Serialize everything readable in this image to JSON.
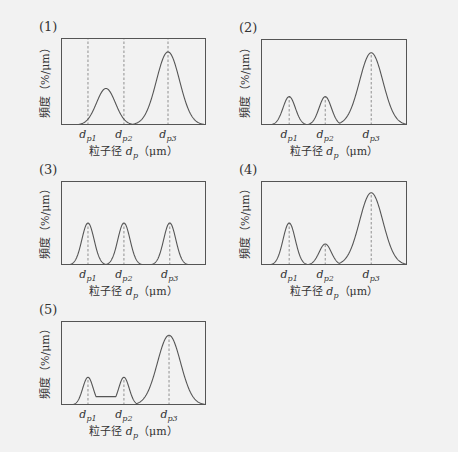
{
  "colors": {
    "background": "#f2f2f2",
    "line": "#555555",
    "dash": "#777777"
  },
  "common": {
    "ylabel": "頻度（%/μm）",
    "xlabel_prefix": "粒子径 ",
    "xlabel_var": "d",
    "xlabel_sub": "p",
    "xlabel_suffix": "（μm）",
    "tick_var": "d",
    "tick_subs": [
      "p1",
      "p2",
      "p3"
    ]
  },
  "chart_data": [
    {
      "type": "line",
      "title": "(1)",
      "xlabel": "粒子径 d_p（μm）",
      "ylabel": "頻度（%/μm）",
      "ticks": [
        "d_p1",
        "d_p2",
        "d_p3"
      ],
      "tick_positions": [
        18.6,
        43.4,
        73.8
      ],
      "dashed_lines": [
        18.6,
        43.4,
        73.8
      ],
      "peaks": [
        {
          "center": 31,
          "height": 42,
          "width": 6.5
        },
        {
          "center": 73.8,
          "height": 84,
          "width": 8
        }
      ],
      "plateau": null
    },
    {
      "type": "line",
      "title": "(2)",
      "xlabel": "粒子径 d_p（μm）",
      "ylabel": "頻度（%/μm）",
      "ticks": [
        "d_p1",
        "d_p2",
        "d_p3"
      ],
      "tick_positions": [
        19.3,
        44,
        75.5
      ],
      "dashed_lines": [
        19.3,
        44,
        75.5
      ],
      "peaks": [
        {
          "center": 19.3,
          "height": 33,
          "width": 4.2
        },
        {
          "center": 44,
          "height": 33,
          "width": 4.2
        },
        {
          "center": 75.5,
          "height": 84,
          "width": 8
        }
      ],
      "plateau": null
    },
    {
      "type": "line",
      "title": "(3)",
      "xlabel": "粒子径 d_p（μm）",
      "ylabel": "頻度（%/μm）",
      "ticks": [
        "d_p1",
        "d_p2",
        "d_p3"
      ],
      "tick_positions": [
        18.6,
        43.4,
        75
      ],
      "dashed_lines": [
        18.6,
        43.4,
        75
      ],
      "peaks": [
        {
          "center": 18.6,
          "height": 50,
          "width": 4.2
        },
        {
          "center": 43.4,
          "height": 50,
          "width": 4.2
        },
        {
          "center": 75,
          "height": 50,
          "width": 4.2
        }
      ],
      "plateau": null
    },
    {
      "type": "line",
      "title": "(4)",
      "xlabel": "粒子径 d_p（μm）",
      "ylabel": "頻度（%/μm）",
      "ticks": [
        "d_p1",
        "d_p2",
        "d_p3"
      ],
      "tick_positions": [
        19.3,
        44,
        75.5
      ],
      "dashed_lines": [
        19.3,
        44,
        75.5
      ],
      "peaks": [
        {
          "center": 19.3,
          "height": 50,
          "width": 4.2
        },
        {
          "center": 44,
          "height": 25,
          "width": 4.2
        },
        {
          "center": 75.5,
          "height": 86,
          "width": 8
        }
      ],
      "plateau": null
    },
    {
      "type": "line",
      "title": "(5)",
      "xlabel": "粒子径 d_p（μm）",
      "ylabel": "頻度（%/μm）",
      "ticks": [
        "d_p1",
        "d_p2",
        "d_p3"
      ],
      "tick_positions": [
        18.6,
        43.4,
        74.5
      ],
      "dashed_lines": [
        18.6,
        43.4,
        74.5
      ],
      "peaks": [
        {
          "center": 18.6,
          "height": 33,
          "width": 3.6
        },
        {
          "center": 43.4,
          "height": 33,
          "width": 3.6
        },
        {
          "center": 74.5,
          "height": 83,
          "width": 8
        }
      ],
      "plateau": {
        "from": 18.6,
        "to": 43.4,
        "height": 10
      }
    }
  ],
  "layout": [
    {
      "left": 61,
      "top": 38,
      "w": 145,
      "h": 87
    },
    {
      "left": 261,
      "top": 39,
      "w": 146,
      "h": 86
    },
    {
      "left": 61,
      "top": 181,
      "w": 145,
      "h": 84
    },
    {
      "left": 261,
      "top": 181,
      "w": 146,
      "h": 84
    },
    {
      "left": 61,
      "top": 321,
      "w": 145,
      "h": 84
    }
  ]
}
